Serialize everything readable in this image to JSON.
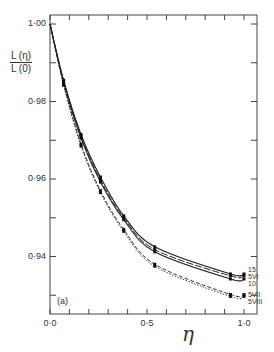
{
  "figure": {
    "header_text": "",
    "panel_label": "(a)"
  },
  "chart_data": {
    "type": "line",
    "title": "",
    "xlabel": "η",
    "ylabel": "L(η)/L(0)",
    "ylabel_numerator": "L (η)",
    "ylabel_denominator": "L (0)",
    "xlim": [
      0.0,
      1.07
    ],
    "ylim": [
      0.925,
      1.002
    ],
    "grid": false,
    "x_tick_labels": [
      "0·0",
      "0·5",
      "1·0"
    ],
    "x_ticks": [
      0.0,
      0.1,
      0.2,
      0.3,
      0.4,
      0.5,
      0.6,
      0.7,
      0.8,
      0.9,
      1.0
    ],
    "y_tick_labels": [
      "1·00",
      "0·98",
      "0·96",
      "0·94"
    ],
    "y_ticks": [
      1.0,
      0.98,
      0.96,
      0.94
    ],
    "y_minor_ticks": [
      0.99,
      0.97,
      0.95,
      0.93
    ],
    "legend_position": "right-end labels",
    "series": [
      {
        "name": "15",
        "style": "solid",
        "x": [
          0.0,
          0.07,
          0.16,
          0.26,
          0.38,
          0.54,
          0.93,
          1.0
        ],
        "values": [
          1.0,
          0.9855,
          0.9715,
          0.9605,
          0.9505,
          0.9425,
          0.9355,
          0.9355
        ]
      },
      {
        "name": "5VI",
        "style": "longdash",
        "x": [
          0.0,
          0.07,
          0.16,
          0.26,
          0.38,
          0.54,
          0.93,
          1.0
        ],
        "values": [
          1.0,
          0.9853,
          0.971,
          0.9598,
          0.95,
          0.9418,
          0.935,
          0.935
        ]
      },
      {
        "name": "10",
        "style": "solid",
        "x": [
          0.0,
          0.07,
          0.16,
          0.26,
          0.38,
          0.54,
          0.93,
          1.0
        ],
        "values": [
          1.0,
          0.985,
          0.9705,
          0.9592,
          0.9495,
          0.9412,
          0.9342,
          0.9342
        ]
      },
      {
        "name": "5VII",
        "style": "dashed",
        "x": [
          0.0,
          0.07,
          0.16,
          0.26,
          0.38,
          0.54,
          0.93,
          1.0
        ],
        "values": [
          1.0,
          0.9845,
          0.969,
          0.957,
          0.947,
          0.938,
          0.9302,
          0.9302
        ]
      },
      {
        "name": "5VIII",
        "style": "dotted",
        "x": [
          0.0,
          0.07,
          0.16,
          0.26,
          0.38,
          0.54,
          0.93,
          1.0
        ],
        "values": [
          1.0,
          0.9842,
          0.9685,
          0.9565,
          0.9465,
          0.9375,
          0.9297,
          0.9297
        ]
      }
    ],
    "annotations": [
      "(a)"
    ]
  }
}
